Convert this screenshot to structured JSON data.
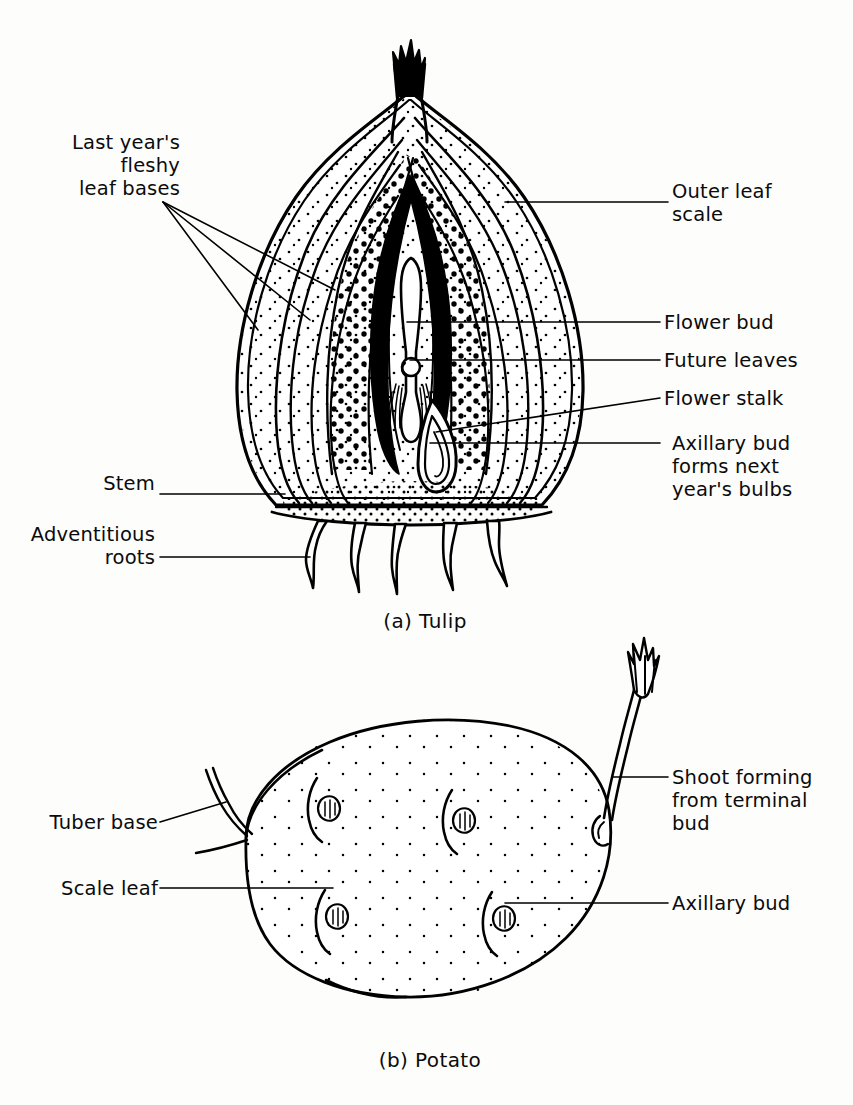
{
  "page": {
    "width": 853,
    "height": 1105,
    "background": "#fdfdfc",
    "ink": "#000000"
  },
  "figures": [
    {
      "id": "tulip",
      "caption": "(a) Tulip",
      "subject": "tulip-bulb-longitudinal-section"
    },
    {
      "id": "potato",
      "caption": "(b) Potato",
      "subject": "potato-tuber-external-view"
    }
  ],
  "tulip": {
    "caption": "(a) Tulip",
    "labels": {
      "fleshy_leaf_bases": "Last year's\nfleshy\nleaf bases",
      "stem": "Stem",
      "adventitious_roots": "Adventitious\nroots",
      "outer_leaf_scale": "Outer leaf\nscale",
      "flower_bud": "Flower bud",
      "future_leaves": "Future leaves",
      "flower_stalk": "Flower stalk",
      "axillary_bud": "Axillary bud\nforms next\nyear's bulbs"
    },
    "parts": [
      "Last year's fleshy leaf bases",
      "Stem",
      "Adventitious roots",
      "Outer leaf scale",
      "Flower bud",
      "Future leaves",
      "Flower stalk",
      "Axillary bud forms next year's bulbs"
    ],
    "root_count": 5,
    "leader_fan_count": 3
  },
  "potato": {
    "caption": "(b) Potato",
    "labels": {
      "tuber_base": "Tuber base",
      "scale_leaf": "Scale leaf",
      "shoot_terminal_bud": "Shoot forming\nfrom terminal\nbud",
      "axillary_bud": "Axillary bud"
    },
    "parts": [
      "Tuber base",
      "Scale leaf",
      "Shoot forming from terminal bud",
      "Axillary bud"
    ],
    "eye_count": 4
  }
}
